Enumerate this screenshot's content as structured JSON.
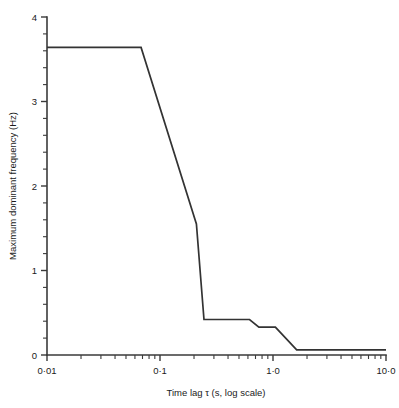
{
  "chart_data": {
    "type": "line",
    "title": "",
    "xlabel": "Time lag τ (s, log scale)",
    "ylabel": "Maximum dominant frequency (Hz)",
    "x_scale": "log",
    "xlim": [
      0.01,
      10.0
    ],
    "ylim": [
      0,
      4
    ],
    "grid": false,
    "legend": null,
    "x_major_ticks": [
      {
        "value": 0.01,
        "label": "0·01"
      },
      {
        "value": 0.1,
        "label": "0·1"
      },
      {
        "value": 1.0,
        "label": "1·0"
      },
      {
        "value": 10.0,
        "label": "10·0"
      }
    ],
    "y_major_ticks": [
      {
        "value": 0,
        "label": "0"
      },
      {
        "value": 1,
        "label": "1"
      },
      {
        "value": 2,
        "label": "2"
      },
      {
        "value": 3,
        "label": "3"
      },
      {
        "value": 4,
        "label": "4"
      }
    ],
    "y_minor_step": 0.2,
    "series": [
      {
        "name": "Maximum dominant frequency",
        "color": "#333333",
        "x": [
          0.01,
          0.068,
          0.21,
          0.245,
          0.32,
          0.62,
          0.75,
          1.05,
          1.62,
          10.0
        ],
        "y": [
          3.64,
          3.64,
          1.55,
          0.42,
          0.42,
          0.42,
          0.33,
          0.33,
          0.06,
          0.06
        ]
      }
    ],
    "annotations": []
  },
  "figure": {
    "background_color": "#ffffff",
    "axis_color": "#3a3a3a",
    "line_color": "#333333"
  }
}
